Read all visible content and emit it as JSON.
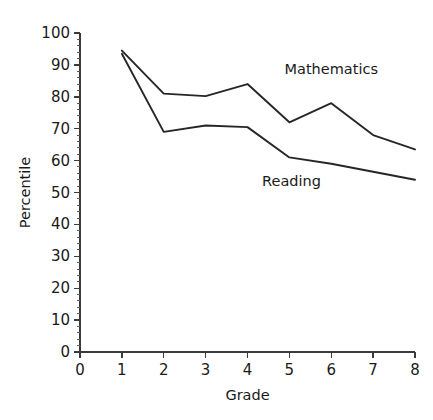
{
  "chart_data": {
    "type": "line",
    "title": "",
    "xlabel": "Grade",
    "ylabel": "Percentile",
    "xlim": [
      0,
      8
    ],
    "ylim": [
      0,
      100
    ],
    "grid": false,
    "legend_position": "inline-annotation",
    "x": [
      1,
      2,
      3,
      4,
      5,
      6,
      7,
      8
    ],
    "xticks": [
      "0",
      "1",
      "2",
      "3",
      "4",
      "5",
      "6",
      "7",
      "8"
    ],
    "xtick_values": [
      0,
      1,
      2,
      3,
      4,
      5,
      6,
      7,
      8
    ],
    "yticks": [
      "0",
      "10",
      "20",
      "30",
      "40",
      "50",
      "60",
      "70",
      "80",
      "90",
      "100"
    ],
    "ytick_values": [
      0,
      10,
      20,
      30,
      40,
      50,
      60,
      70,
      80,
      90,
      100
    ],
    "y_minor_step": 2,
    "series": [
      {
        "name": "Mathematics",
        "values": [
          94.5,
          81,
          80.2,
          84,
          72,
          78,
          68,
          63.5
        ],
        "label_x": 6.0,
        "label_y": 87.0
      },
      {
        "name": "Reading",
        "values": [
          93.5,
          69,
          71,
          70.5,
          61,
          59,
          56.5,
          54
        ],
        "label_x": 5.05,
        "label_y": 52.0
      }
    ],
    "annotations": [
      {
        "text": "Mathematics",
        "x": 6.0,
        "y": 87.0
      },
      {
        "text": "Reading",
        "x": 5.05,
        "y": 52.0
      }
    ],
    "colors": {
      "line": "#262626",
      "axis": "#3a3a3a",
      "text": "#1a1a1a",
      "background": "#ffffff"
    }
  }
}
